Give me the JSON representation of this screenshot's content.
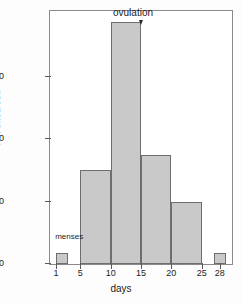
{
  "chart_data": {
    "type": "bar",
    "title": "",
    "xlabel": "days",
    "ylabel": "PR sites/cell",
    "xlim": [
      0,
      30
    ],
    "ylim": [
      0,
      16200
    ],
    "grid": false,
    "legend": "none",
    "x_ticks": [
      1,
      5,
      10,
      15,
      20,
      25,
      28
    ],
    "y_ticks": [
      0,
      4000,
      8000,
      12000
    ],
    "y_tick_labels": [
      "0",
      "4000",
      "8000",
      "12000"
    ],
    "bins": [
      {
        "label": "1-3",
        "x_start": 1,
        "x_end": 3,
        "value": 700
      },
      {
        "label": "5-10",
        "x_start": 5,
        "x_end": 10,
        "value": 6000
      },
      {
        "label": "10-15",
        "x_start": 10,
        "x_end": 15,
        "value": 15500
      },
      {
        "label": "15-20",
        "x_start": 15,
        "x_end": 20,
        "value": 7000
      },
      {
        "label": "20-25",
        "x_start": 20,
        "x_end": 25,
        "value": 4000
      },
      {
        "label": "27-29",
        "x_start": 27,
        "x_end": 29,
        "value": 700
      }
    ],
    "annotations": [
      {
        "name": "menses",
        "text": "menses",
        "x": 2,
        "y": 1500
      },
      {
        "name": "ovulation",
        "text": "ovulation",
        "x": 15,
        "y": 16000
      }
    ],
    "colors": {
      "bar_fill": "#c9c9c9",
      "bar_edge": "#6e6e6e",
      "axis": "#5a5a5a",
      "text": "#1c1c1c",
      "background": "#ffffff"
    }
  }
}
